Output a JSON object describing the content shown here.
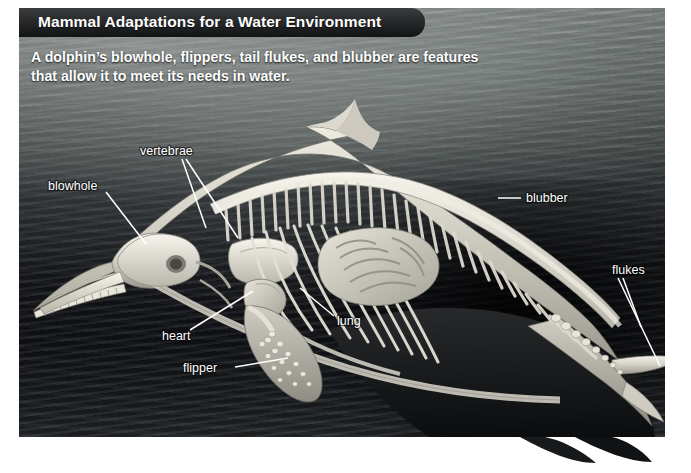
{
  "header": {
    "title": "Mammal Adaptations for a Water Environment"
  },
  "caption": {
    "line1": "A dolphin’s blowhole, flippers, tail flukes, and blubber are features",
    "line2": "that allow it to meet its needs in water."
  },
  "diagram": {
    "labels": [
      {
        "id": "vertebrae",
        "text": "vertebrae"
      },
      {
        "id": "blowhole",
        "text": "blowhole"
      },
      {
        "id": "blubber",
        "text": "blubber"
      },
      {
        "id": "flukes",
        "text": "flukes"
      },
      {
        "id": "lung",
        "text": "lung"
      },
      {
        "id": "heart",
        "text": "heart"
      },
      {
        "id": "flipper",
        "text": "flipper"
      }
    ]
  },
  "colors": {
    "panel_dark": "#14161a",
    "title_bar": "#232527",
    "label_text": "#ffffff",
    "bone_light": "#e9e6dd",
    "page_background": "#ffffff"
  }
}
